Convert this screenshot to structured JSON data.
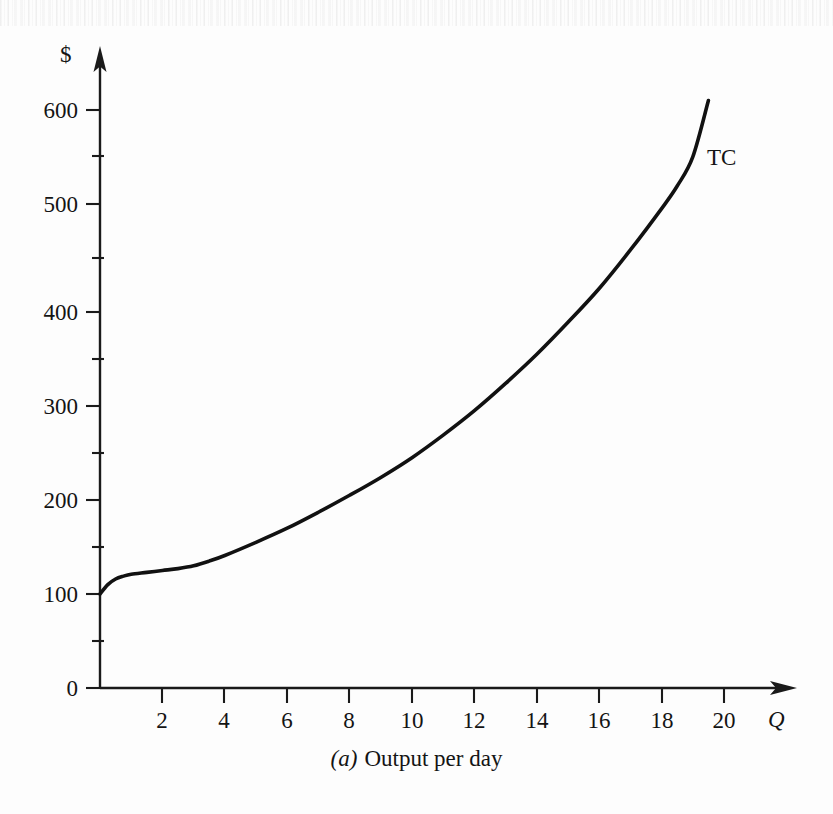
{
  "figure": {
    "caption_panel_letter": "(a)",
    "caption_text": "Output per day",
    "background_color": "#fdfdfd",
    "ink_color": "#111111"
  },
  "chart_data": {
    "type": "line",
    "title": "",
    "subtitle": "",
    "xlabel": "Q",
    "ylabel": "$",
    "x_axis_title": "Q",
    "y_axis_title": "$",
    "xlim": [
      0,
      22
    ],
    "ylim": [
      0,
      660
    ],
    "grid": false,
    "legend_position": "inline-right",
    "x_ticks": [
      2,
      4,
      6,
      8,
      10,
      12,
      14,
      16,
      18,
      20
    ],
    "x_tick_labels": [
      "2",
      "4",
      "6",
      "8",
      "10",
      "12",
      "14",
      "16",
      "18",
      "20"
    ],
    "x_minor_ticks": [],
    "y_ticks": [
      0,
      100,
      200,
      300,
      400,
      500,
      600
    ],
    "y_tick_labels": [
      "0",
      "100",
      "200",
      "300",
      "400",
      "500",
      "600"
    ],
    "y_minor_ticks": [
      50,
      150,
      250,
      350,
      450,
      550
    ],
    "series": [
      {
        "name": "TC",
        "label": "TC",
        "label_x": 19.2,
        "label_y": 565,
        "color": "#111111",
        "x": [
          0,
          0.25,
          0.5,
          0.75,
          1,
          1.5,
          2,
          2.5,
          3,
          3.5,
          4,
          5,
          6,
          7,
          8,
          9,
          10,
          11,
          12,
          13,
          14,
          15,
          16,
          17,
          18,
          18.5,
          19,
          19.5
        ],
        "values": [
          100,
          110,
          116,
          119,
          121,
          123,
          125,
          127,
          130,
          135,
          141,
          155,
          170,
          187,
          205,
          224,
          245,
          269,
          295,
          324,
          355,
          389,
          425,
          466,
          510,
          534,
          565,
          625
        ]
      }
    ],
    "annotations": [
      {
        "text": "TC",
        "x": 19.2,
        "y": 565
      }
    ]
  }
}
